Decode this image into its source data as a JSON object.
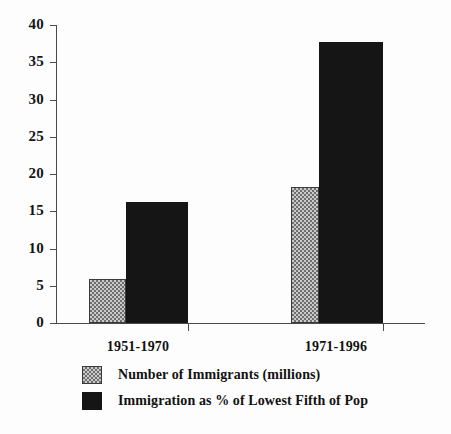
{
  "chart_data": {
    "type": "bar",
    "title": "",
    "xlabel": "",
    "ylabel": "",
    "ylim": [
      0,
      40
    ],
    "yticks": [
      0,
      5,
      10,
      15,
      20,
      25,
      30,
      35,
      40
    ],
    "ytick_labels": [
      "0",
      "5",
      "10",
      "15",
      "20",
      "25",
      "30",
      "35",
      "40"
    ],
    "grid": false,
    "legend_position": "bottom-left",
    "categories": [
      "1951-1970",
      "1971-1996"
    ],
    "series": [
      {
        "name": "Number of Immigrants (millions)",
        "style": "hatched",
        "color": "#c9c9c9",
        "values": [
          5.9,
          18.3
        ]
      },
      {
        "name": "Immigration as % of Lowest Fifth of Pop",
        "style": "solid",
        "color": "#151515",
        "values": [
          16.2,
          37.7
        ]
      }
    ]
  },
  "legend": {
    "items": [
      {
        "label": "Number of Immigrants (millions)",
        "swatch": "hatched-swatch"
      },
      {
        "label": "Immigration as % of Lowest Fifth of Pop",
        "swatch": "solid-black-swatch"
      }
    ]
  }
}
